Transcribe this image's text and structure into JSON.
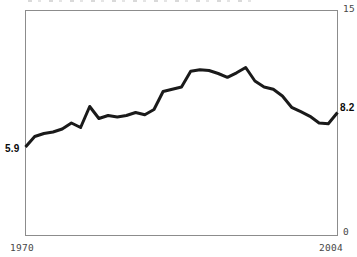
{
  "labels": {
    "start_value": "5.9",
    "end_value": "8.2"
  },
  "axes": {
    "y_max": "15",
    "y_min": "0",
    "x_start": "1970",
    "x_end": "2004"
  },
  "colors": {
    "line": "#1a1a1a",
    "frame": "#8c8c8c",
    "tick_text": "#474747",
    "value_text": "#0a0a0a",
    "background": "#ffffff"
  },
  "chart_data": {
    "type": "line",
    "title": "",
    "xlabel": "",
    "ylabel": "",
    "x": [
      1970,
      1971,
      1972,
      1973,
      1974,
      1975,
      1976,
      1977,
      1978,
      1979,
      1980,
      1981,
      1982,
      1983,
      1984,
      1985,
      1986,
      1987,
      1988,
      1989,
      1990,
      1991,
      1992,
      1993,
      1994,
      1995,
      1996,
      1997,
      1998,
      1999,
      2000,
      2001,
      2002,
      2003,
      2004
    ],
    "values": [
      5.9,
      6.6,
      6.8,
      6.9,
      7.1,
      7.5,
      7.2,
      8.6,
      7.8,
      8.0,
      7.9,
      8.0,
      8.2,
      8.05,
      8.4,
      9.6,
      9.75,
      9.9,
      10.95,
      11.05,
      11.0,
      10.8,
      10.55,
      10.85,
      11.2,
      10.3,
      9.9,
      9.75,
      9.3,
      8.55,
      8.25,
      7.95,
      7.5,
      7.45,
      8.2
    ],
    "xlim": [
      1970,
      2004
    ],
    "ylim": [
      0,
      15
    ],
    "grid": false,
    "legend": "none",
    "annotations": [
      {
        "text": "5.9",
        "x": 1970,
        "y": 5.9,
        "position": "left-of-start"
      },
      {
        "text": "8.2",
        "x": 2004,
        "y": 8.2,
        "position": "right-of-end"
      },
      {
        "text": "15",
        "position": "top-right-outside-frame"
      },
      {
        "text": "0",
        "position": "bottom-right-outside-frame"
      }
    ]
  }
}
